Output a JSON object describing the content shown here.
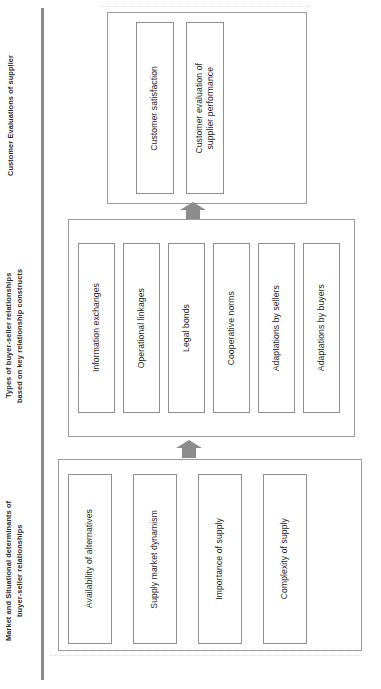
{
  "diagram": {
    "orientation": "rotated-90",
    "accent_color": "#8a8a8a",
    "border_color": "#8f8f8f",
    "sections": [
      {
        "id": "outcomes",
        "axis_label": "Customer Evaluations of supplier",
        "items": [
          "Customer satisfaction",
          "Customer evaluation of\nsupplier performance"
        ]
      },
      {
        "id": "relationship-types",
        "axis_label": "Types of buyer-seller relationships\nbased on key relationship constructs",
        "items": [
          "Information exchanges",
          "Operational linkages",
          "Legal bonds",
          "Cooperative norms",
          "Adaptations by sellers",
          "Adaptations by buyers"
        ]
      },
      {
        "id": "determinants",
        "axis_label": "Market and Situational  determinants of\nbuyer-seller relationships",
        "items": [
          "Availability of alternatives",
          "Supply market dynamism",
          "Importance of supply",
          "Complexity of supply"
        ]
      }
    ],
    "connectors": [
      {
        "id": "determinants-to-types",
        "glyph": "block-arrow-up"
      },
      {
        "id": "types-to-outcomes",
        "glyph": "block-arrow-up"
      }
    ]
  }
}
